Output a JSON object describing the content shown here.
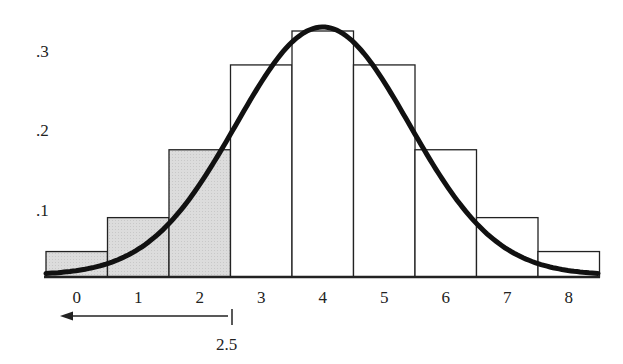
{
  "chart_data": {
    "type": "bar",
    "title": "",
    "xlabel": "",
    "ylabel": "",
    "categories": [
      "0",
      "1",
      "2",
      "3",
      "4",
      "5",
      "6",
      "7",
      "8"
    ],
    "values": [
      0.03,
      0.07,
      0.15,
      0.25,
      0.29,
      0.25,
      0.15,
      0.07,
      0.03
    ],
    "shaded_categories": [
      "0",
      "1",
      "2"
    ],
    "y_ticks": [
      ".1",
      ".2",
      ".3"
    ],
    "ylim": [
      0,
      0.33
    ],
    "grid": false,
    "overlay": {
      "type": "normal-curve",
      "mean": 4
    },
    "annotation": {
      "label": "2.5",
      "arrow": "left",
      "x": 2.5
    }
  },
  "colors": {
    "shaded": "#d9d9d9",
    "unshaded": "#ffffff",
    "stroke": "#222222",
    "curve": "#111111"
  }
}
